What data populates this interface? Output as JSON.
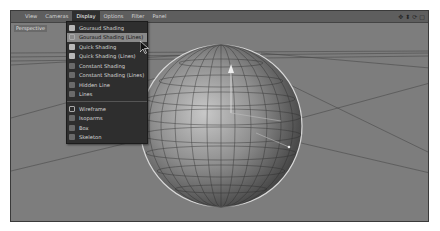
{
  "menubar": {
    "items": [
      "View",
      "Cameras",
      "Display",
      "Options",
      "Filter",
      "Panel"
    ],
    "active": "Display"
  },
  "nav_icons": [
    "move-icon",
    "zoom-icon",
    "rotate-icon",
    "maximize-icon"
  ],
  "viewport": {
    "camera_label": "Perspective"
  },
  "display_menu": {
    "items": [
      {
        "label": "Gouraud Shading",
        "icon": "gouraud-shading-icon"
      },
      {
        "label": "Gouraud Shading (Lines)",
        "icon": "gouraud-lines-icon",
        "highlighted": true
      },
      {
        "label": "Quick Shading",
        "icon": "quick-shading-icon"
      },
      {
        "label": "Quick Shading (Lines)",
        "icon": "quick-lines-icon"
      },
      {
        "label": "Constant Shading",
        "icon": "constant-shading-icon"
      },
      {
        "label": "Constant Shading (Lines)",
        "icon": "constant-lines-icon"
      },
      {
        "label": "Hidden Line",
        "icon": "hidden-line-icon"
      },
      {
        "label": "Lines",
        "icon": "lines-icon"
      }
    ],
    "items2": [
      {
        "label": "Wireframe",
        "icon": "wireframe-icon"
      },
      {
        "label": "Isoparms",
        "icon": "isoparms-icon"
      },
      {
        "label": "Box",
        "icon": "box-icon"
      },
      {
        "label": "Skeleton",
        "icon": "skeleton-icon"
      }
    ]
  },
  "colors": {
    "viewport_bg": "#7d7d7d",
    "menubar_bg": "#5e5e5e",
    "menu_bg": "#2e2e2e",
    "highlight": "#8a8a8a"
  }
}
